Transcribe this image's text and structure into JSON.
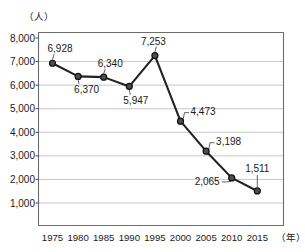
{
  "chart_data": {
    "type": "line",
    "title": "",
    "subtitle": "",
    "xlabel": "（年）",
    "ylabel": "（人）",
    "categories": [
      "1975",
      "1980",
      "1985",
      "1990",
      "1995",
      "2000",
      "2005",
      "2010",
      "2015"
    ],
    "values": [
      6928,
      6370,
      6340,
      5947,
      7253,
      4473,
      3198,
      2065,
      1511
    ],
    "point_labels": [
      "6,928",
      "6,370",
      "6,340",
      "5,947",
      "7,253",
      "4,473",
      "3,198",
      "2,065",
      "1,511"
    ],
    "ylim": [
      0,
      8000
    ],
    "ytick_values": [
      8000,
      7000,
      6000,
      5000,
      4000,
      3000,
      2000,
      1000
    ],
    "ytick_labels": [
      "8,000",
      "7,000",
      "6,000",
      "5,000",
      "4,000",
      "3,000",
      "2,000",
      "1,000"
    ],
    "grid": true,
    "legend": "none",
    "marker": "circle",
    "line_color": "#222222",
    "marker_color": "#4d4d4d",
    "grid_color": "#b9b9b9",
    "frame_color": "#6e6e6e"
  },
  "axes": {
    "y_unit_label": "（人）",
    "x_unit_label": "（年）"
  }
}
